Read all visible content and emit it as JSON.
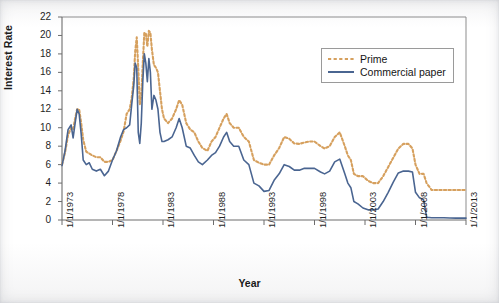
{
  "chart_data": {
    "type": "line",
    "title": "",
    "xlabel": "Year",
    "ylabel": "Interest Rate",
    "ylim": [
      0,
      22
    ],
    "ytick_labels": [
      "0",
      "2",
      "4",
      "6",
      "8",
      "10",
      "12",
      "14",
      "16",
      "18",
      "20",
      "22"
    ],
    "yticks": [
      0,
      2,
      4,
      6,
      8,
      10,
      12,
      14,
      16,
      18,
      20,
      22
    ],
    "xtick_labels": [
      "1/1/1973",
      "1/1/1978",
      "1/1/1983",
      "1/1/1988",
      "1/1/1993",
      "1/1/1998",
      "1/1/2003",
      "1/1/2008",
      "1/1/2013"
    ],
    "xlim": [
      1973,
      2013
    ],
    "xticks": [
      1973,
      1978,
      1983,
      1988,
      1993,
      1998,
      2003,
      2008,
      2013
    ],
    "grid": false,
    "legend_position": "upper right",
    "colors": {
      "prime": "#d6a05e",
      "commercial_paper": "#4a6591",
      "axis": "#6d6d6d",
      "text": "#1a1a1a"
    },
    "series": [
      {
        "name": "Prime",
        "style": "dotted",
        "color": "#d6a05e",
        "x": [
          1973.0,
          1973.3,
          1973.6,
          1973.9,
          1974.1,
          1974.3,
          1974.5,
          1974.7,
          1974.9,
          1975.1,
          1975.4,
          1975.7,
          1976.0,
          1976.4,
          1976.8,
          1977.2,
          1977.6,
          1978.0,
          1978.4,
          1978.8,
          1979.1,
          1979.4,
          1979.7,
          1979.9,
          1980.1,
          1980.25,
          1980.4,
          1980.55,
          1980.7,
          1980.85,
          1981.0,
          1981.15,
          1981.3,
          1981.45,
          1981.6,
          1981.75,
          1981.9,
          1982.1,
          1982.3,
          1982.5,
          1982.7,
          1982.9,
          1983.1,
          1983.5,
          1983.9,
          1984.3,
          1984.6,
          1984.9,
          1985.3,
          1985.7,
          1986.1,
          1986.5,
          1986.9,
          1987.4,
          1987.8,
          1988.2,
          1988.6,
          1989.0,
          1989.3,
          1989.6,
          1990.0,
          1990.5,
          1991.0,
          1991.5,
          1992.0,
          1992.5,
          1993.0,
          1993.5,
          1994.0,
          1994.5,
          1995.0,
          1995.5,
          1996.0,
          1996.5,
          1997.0,
          1997.5,
          1998.0,
          1998.6,
          1999.0,
          1999.5,
          2000.0,
          2000.5,
          2001.0,
          2001.3,
          2001.6,
          2001.9,
          2002.3,
          2002.8,
          2003.3,
          2003.8,
          2004.3,
          2004.8,
          2005.3,
          2005.8,
          2006.3,
          2006.8,
          2007.3,
          2007.7,
          2008.0,
          2008.4,
          2008.8,
          2009.1,
          2009.6,
          2010.2,
          2010.8,
          2011.4,
          2012.0,
          2012.6,
          2013.0
        ],
        "y": [
          6.0,
          7.3,
          9.2,
          10.0,
          9.8,
          11.0,
          12.0,
          12.0,
          10.5,
          8.7,
          7.4,
          7.2,
          7.0,
          6.8,
          6.8,
          6.3,
          6.3,
          6.5,
          7.5,
          8.6,
          9.6,
          11.5,
          12.0,
          13.2,
          15.3,
          18.3,
          19.8,
          16.5,
          12.5,
          13.5,
          17.0,
          20.3,
          20.2,
          18.8,
          20.5,
          20.3,
          18.5,
          16.8,
          16.5,
          16.0,
          14.0,
          12.0,
          11.0,
          10.5,
          11.0,
          12.0,
          13.0,
          12.5,
          10.5,
          9.8,
          9.5,
          8.5,
          7.8,
          7.5,
          8.5,
          9.0,
          10.0,
          11.0,
          11.5,
          10.5,
          10.0,
          10.0,
          9.0,
          8.5,
          6.5,
          6.2,
          6.0,
          6.0,
          7.0,
          7.8,
          9.0,
          8.8,
          8.3,
          8.25,
          8.4,
          8.5,
          8.5,
          8.0,
          7.75,
          8.0,
          9.0,
          9.5,
          8.0,
          7.0,
          6.5,
          5.0,
          4.75,
          4.75,
          4.25,
          4.0,
          4.0,
          4.75,
          5.75,
          6.75,
          7.75,
          8.25,
          8.25,
          7.75,
          6.0,
          5.0,
          5.0,
          4.0,
          3.25,
          3.25,
          3.25,
          3.25,
          3.25,
          3.25,
          3.25
        ]
      },
      {
        "name": "Commercial paper",
        "style": "solid",
        "color": "#4a6591",
        "x": [
          1973.0,
          1973.3,
          1973.6,
          1973.9,
          1974.1,
          1974.3,
          1974.5,
          1974.7,
          1974.9,
          1975.1,
          1975.4,
          1975.7,
          1976.0,
          1976.4,
          1976.8,
          1977.2,
          1977.6,
          1978.0,
          1978.4,
          1978.8,
          1979.1,
          1979.4,
          1979.7,
          1979.9,
          1980.1,
          1980.25,
          1980.4,
          1980.55,
          1980.7,
          1980.85,
          1981.0,
          1981.15,
          1981.3,
          1981.45,
          1981.6,
          1981.75,
          1981.9,
          1982.1,
          1982.3,
          1982.5,
          1982.7,
          1982.9,
          1983.1,
          1983.5,
          1983.9,
          1984.3,
          1984.6,
          1984.9,
          1985.3,
          1985.7,
          1986.1,
          1986.5,
          1986.9,
          1987.4,
          1987.8,
          1988.2,
          1988.6,
          1989.0,
          1989.3,
          1989.6,
          1990.0,
          1990.5,
          1991.0,
          1991.5,
          1992.0,
          1992.5,
          1993.0,
          1993.5,
          1994.0,
          1994.5,
          1995.0,
          1995.5,
          1996.0,
          1996.5,
          1997.0,
          1997.5,
          1998.0,
          1998.6,
          1999.0,
          1999.5,
          2000.0,
          2000.5,
          2001.0,
          2001.3,
          2001.6,
          2001.9,
          2002.3,
          2002.8,
          2003.3,
          2003.8,
          2004.3,
          2004.8,
          2005.3,
          2005.8,
          2006.3,
          2006.8,
          2007.3,
          2007.7,
          2008.0,
          2008.4,
          2008.8,
          2009.1,
          2009.6,
          2010.2,
          2010.8,
          2011.4,
          2012.0,
          2012.6,
          2013.0
        ],
        "y": [
          5.9,
          7.5,
          9.8,
          10.3,
          8.9,
          10.5,
          12.0,
          11.5,
          9.3,
          6.5,
          6.0,
          6.2,
          5.5,
          5.3,
          5.5,
          4.8,
          5.3,
          6.5,
          7.5,
          9.0,
          9.8,
          10.0,
          10.3,
          12.5,
          14.5,
          17.0,
          16.5,
          9.5,
          8.3,
          10.5,
          15.0,
          18.0,
          17.0,
          15.0,
          17.5,
          16.0,
          12.0,
          13.5,
          13.0,
          12.0,
          9.5,
          8.5,
          8.5,
          8.7,
          9.0,
          10.0,
          11.0,
          10.0,
          8.0,
          7.8,
          7.0,
          6.3,
          6.0,
          6.5,
          7.0,
          7.3,
          8.0,
          9.0,
          9.5,
          8.5,
          8.0,
          8.0,
          6.5,
          6.0,
          4.0,
          3.7,
          3.1,
          3.2,
          4.3,
          5.0,
          6.0,
          5.8,
          5.4,
          5.4,
          5.6,
          5.6,
          5.6,
          5.2,
          5.0,
          5.3,
          6.3,
          6.6,
          5.0,
          4.0,
          3.5,
          2.0,
          1.75,
          1.3,
          1.1,
          1.1,
          1.2,
          2.0,
          3.0,
          4.1,
          5.1,
          5.3,
          5.3,
          5.2,
          3.0,
          2.4,
          2.2,
          0.3,
          0.25,
          0.25,
          0.25,
          0.22,
          0.2,
          0.2,
          0.2
        ]
      }
    ]
  },
  "legend": {
    "items": [
      {
        "label": "Prime",
        "style": "dotted",
        "color": "#d6a05e"
      },
      {
        "label": "Commercial paper",
        "style": "solid",
        "color": "#4a6591"
      }
    ]
  }
}
